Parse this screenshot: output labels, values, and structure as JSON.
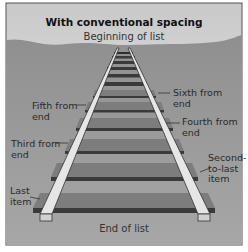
{
  "figure": {
    "title": "With conventional spacing",
    "top_label": "Beginning of list",
    "bottom_label": "End of list",
    "colors": {
      "sky_top": "#cfcfcf",
      "sky_bottom": "#ededed",
      "ground": "#9a9a9a",
      "rail": "#e4e4e4",
      "tie": "#7d7d7d",
      "tie_shadow": "#3e3e3e",
      "border": "#555555"
    }
  },
  "labels": {
    "sixth": "Sixth from\nend",
    "fifth": "Fifth from\nend",
    "fourth": "Fourth from\nend",
    "third": "Third from\nend",
    "second": "Second-\nto-last\nitem",
    "last": "Last\nitem"
  }
}
